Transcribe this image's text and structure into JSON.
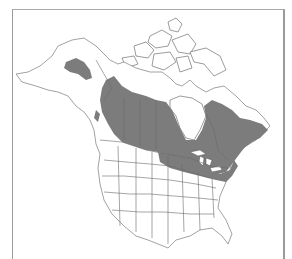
{
  "map": {
    "type": "species-range-map",
    "region": "North America",
    "style": "grayscale",
    "colors": {
      "background": "#ffffff",
      "land": "#ffffff",
      "range_fill": "#7c7c7c",
      "boundary_lines": "#6a6a6a",
      "frame": "#9a9a9a"
    },
    "shaded_regions": [
      "Interior Alaska",
      "Canadian boreal zone (Yukon, NWT, Prairies, Ontario, Quebec, Labrador, Maritimes, Newfoundland)",
      "Northern Great Lakes states and New England"
    ],
    "political_boundaries": [
      "Canadian provinces",
      "US states"
    ]
  }
}
